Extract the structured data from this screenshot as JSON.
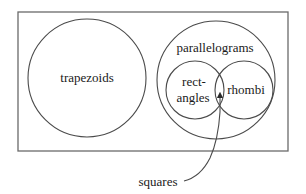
{
  "diagram": {
    "type": "venn",
    "universe_box": {
      "x": 18,
      "y": 12,
      "width": 270,
      "height": 139
    },
    "sets": [
      {
        "id": "trapezoids",
        "label": "trapezoids",
        "cx": 87,
        "cy": 78,
        "r": 59
      },
      {
        "id": "parallelograms",
        "label": "parallelograms",
        "cx": 216,
        "cy": 80,
        "r": 59
      },
      {
        "id": "rectangles",
        "label_line1": "rect-",
        "label_line2": "angles",
        "cx": 195,
        "cy": 90,
        "r": 29
      },
      {
        "id": "rhombi",
        "label": "rhombi",
        "cx": 244,
        "cy": 90,
        "r": 29
      }
    ],
    "callout": {
      "label": "squares",
      "points_to": "intersection of rectangles and rhombi"
    },
    "colors": {
      "stroke": "#4a4a4a",
      "frame": "#6a6a6a",
      "text": "#1a1a1a",
      "background": "#ffffff"
    }
  }
}
